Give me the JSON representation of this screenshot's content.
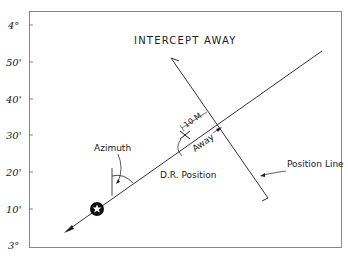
{
  "diagram": {
    "title": "INTERCEPT AWAY",
    "y_axis_labels": [
      "4°",
      "50'",
      "40'",
      "30'",
      "20'",
      "10'",
      "3°"
    ],
    "labels": {
      "azimuth": "Azimuth",
      "dr_position": "D.R. Position",
      "position_line": "Position Line",
      "intercept_distance": "10 M",
      "away": "Away"
    },
    "colors": {
      "line": "#333333",
      "frame": "#888888",
      "background": "#ffffff"
    }
  }
}
